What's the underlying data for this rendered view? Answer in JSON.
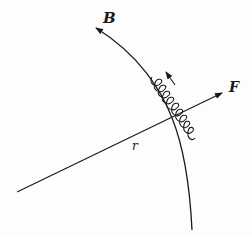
{
  "diagram": {
    "labels": {
      "field": "B",
      "force": "F",
      "radius": "r"
    },
    "elements": [
      {
        "name": "magnetic-field-line",
        "label": "B",
        "type": "curved-arrow"
      },
      {
        "name": "radial-line",
        "label": "r",
        "type": "line"
      },
      {
        "name": "force-arrow",
        "label": "F",
        "type": "arrow"
      },
      {
        "name": "helical-particle-path",
        "type": "helix"
      },
      {
        "name": "motion-direction-arrow",
        "type": "small-arrow"
      }
    ],
    "colors": {
      "stroke": "#1a1a1a",
      "background": "#fdfdfd"
    }
  }
}
